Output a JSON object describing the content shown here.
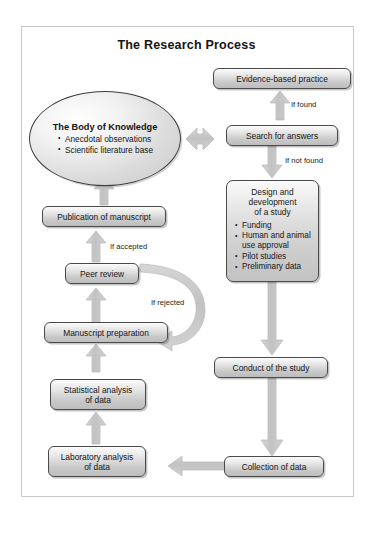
{
  "diagram": {
    "title": "The Research Process",
    "type": "flowchart",
    "ellipse": {
      "heading": "The Body of Knowledge",
      "bullets": [
        "Anecdotal observations",
        "Scientific literature base"
      ]
    },
    "nodes": [
      {
        "id": "evidence",
        "label": "Evidence-based practice"
      },
      {
        "id": "search",
        "label": "Search for answers"
      },
      {
        "id": "design_head1",
        "label": "Design and"
      },
      {
        "id": "design_head2",
        "label": "development"
      },
      {
        "id": "design_head3",
        "label": "of a study"
      },
      {
        "id": "conduct",
        "label": "Conduct of the study"
      },
      {
        "id": "collection",
        "label": "Collection of data"
      },
      {
        "id": "laboratory",
        "label": "Laboratory analysis\nof data"
      },
      {
        "id": "statistical",
        "label": "Statistical analysis\nof data"
      },
      {
        "id": "manuscript",
        "label": "Manuscript preparation"
      },
      {
        "id": "peerreview",
        "label": "Peer review"
      },
      {
        "id": "publication",
        "label": "Publication of manuscript"
      }
    ],
    "design_box": {
      "heading_line1": "Design and",
      "heading_line2": "development",
      "heading_line3": "of a study",
      "bullets": [
        "Funding",
        "Human and animal use approval",
        "Pilot studies",
        "Preliminary data"
      ]
    },
    "labels": {
      "evidence": "Evidence-based practice",
      "search": "Search for answers",
      "conduct": "Conduct of the study",
      "collection": "Collection of data",
      "laboratory_line1": "Laboratory analysis",
      "laboratory_line2": "of data",
      "statistical_line1": "Statistical analysis",
      "statistical_line2": "of data",
      "manuscript": "Manuscript preparation",
      "peerreview": "Peer review",
      "publication": "Publication of manuscript"
    },
    "edge_labels": {
      "if_found": "If found",
      "if_not_found": "If not found",
      "if_accepted": "If accepted",
      "if_rejected": "If rejected"
    },
    "colors": {
      "arrow_fill": "#c6c6c6",
      "arrow_stroke": "#b4b4b4",
      "node_border": "#4a4a4a",
      "frame_border": "#c9c9c9",
      "background": "#ffffff",
      "text": "#161616"
    }
  }
}
